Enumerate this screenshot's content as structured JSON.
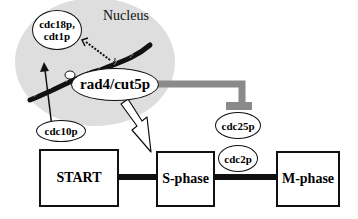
{
  "diagram": {
    "type": "cell-cycle-pathway",
    "nucleus_label": "Nucleus",
    "proteins": {
      "cdc18p_cdt1p": "cdc18p,\ncdt1p",
      "cdc18p_line1": "cdc18p,",
      "cdc18p_line2": "cdt1p",
      "rad4": "rad4/cut5p",
      "cdc10p": "cdc10p",
      "cdc25p": "cdc25p",
      "cdc2p": "cdc2p"
    },
    "phases": {
      "start": "START",
      "s_phase": "S-phase",
      "m_phase": "M-phase"
    },
    "colors": {
      "nucleus_fill": "#dedede",
      "inhibition_bar": "#8a8a8a",
      "line": "#111111",
      "background": "#ffffff"
    },
    "edges": [
      {
        "from": "cdc10p",
        "to": "cdc18p,cdt1p",
        "style": "solid-arrow"
      },
      {
        "from": "rad4/cut5p",
        "to": "cdc18p,cdt1p",
        "style": "dotted-arrow"
      },
      {
        "from": "rad4/cut5p",
        "to": "cdc25p",
        "style": "inhibition"
      },
      {
        "from": "nucleus",
        "to": "S-phase",
        "style": "hollow-arrow"
      },
      {
        "from": "START",
        "to": "S-phase",
        "style": "thick-line"
      },
      {
        "from": "S-phase",
        "to": "M-phase",
        "style": "thick-line"
      }
    ]
  }
}
